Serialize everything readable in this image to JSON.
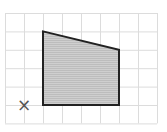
{
  "diagram": {
    "type": "grid-shape",
    "grid": {
      "columns": 8,
      "rows": 6,
      "line_color": "#d9d9d9"
    },
    "shape": {
      "kind": "quadrilateral",
      "vertices_grid": [
        [
          2,
          1
        ],
        [
          6,
          2
        ],
        [
          6,
          5
        ],
        [
          2,
          5
        ]
      ],
      "fill": "#c9c9c9",
      "stroke": "#222222"
    },
    "marker": {
      "symbol": "×",
      "grid_position": [
        1,
        5
      ],
      "color": "#555555"
    }
  }
}
